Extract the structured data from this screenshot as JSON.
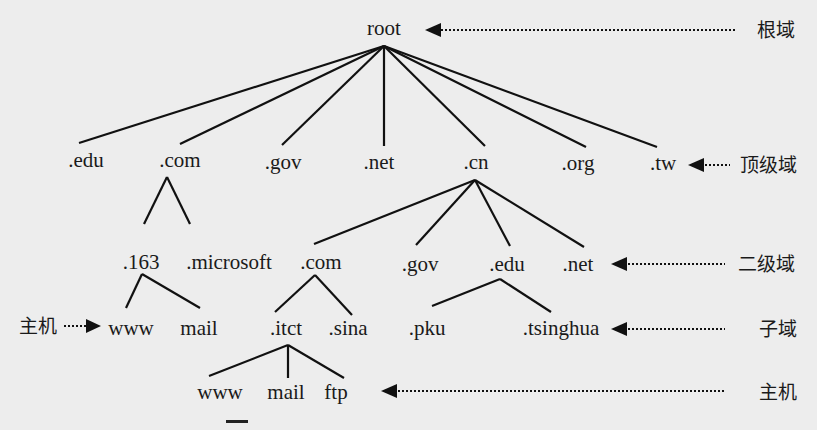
{
  "diagram": {
    "nodes": {
      "root": "root",
      "tld": [
        ".edu",
        ".com",
        ".gov",
        ".net",
        ".cn",
        ".org",
        ".tw"
      ],
      "com_children": [
        ".163",
        ".microsoft"
      ],
      "cn_children": [
        ".com",
        ".gov",
        ".edu",
        ".net"
      ],
      "n163_children": [
        "www",
        "mail"
      ],
      "cn_com_children": [
        ".itct",
        ".sina"
      ],
      "cn_edu_children": [
        ".pku",
        ".tsinghua"
      ],
      "itct_children": [
        "www",
        "mail",
        "ftp"
      ]
    },
    "level_labels": {
      "root_domain": "根域",
      "top_level_domain": "顶级域",
      "second_level_domain": "二级域",
      "subdomain": "子域",
      "host": "主机",
      "host_left": "主机"
    }
  }
}
